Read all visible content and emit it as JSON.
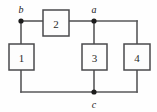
{
  "diagram": {
    "type": "circuit-schematic",
    "title": "",
    "background_color": "#fefefe",
    "wire_color": "#58585a",
    "box_stroke_color": "#4a4a4c",
    "box_fill_color": "#fdfdfd",
    "node_color": "#1c1c1c",
    "label_color": "#1c1c1c",
    "boxes": [
      {
        "id": "box-1",
        "label": "1",
        "orientation": "vertical",
        "x": 9,
        "y": 44,
        "w": 25,
        "h": 26
      },
      {
        "id": "box-2",
        "label": "2",
        "orientation": "horizontal",
        "x": 43,
        "y": 10,
        "w": 26,
        "h": 26
      },
      {
        "id": "box-3",
        "label": "3",
        "orientation": "vertical",
        "x": 82,
        "y": 44,
        "w": 25,
        "h": 26
      },
      {
        "id": "box-4",
        "label": "4",
        "orientation": "vertical",
        "x": 124,
        "y": 44,
        "w": 26,
        "h": 26
      }
    ],
    "nodes": [
      {
        "id": "node-b",
        "label": "b",
        "x": 21,
        "y": 21,
        "label_x": 21,
        "label_y": 9
      },
      {
        "id": "node-a",
        "label": "a",
        "x": 94,
        "y": 21,
        "label_x": 94,
        "label_y": 9
      },
      {
        "id": "node-c",
        "label": "c",
        "x": 94,
        "y": 92,
        "label_x": 94,
        "label_y": 104
      }
    ],
    "wires": [
      {
        "id": "wire-b-to-box2",
        "d": "M 21 21 L 43 21"
      },
      {
        "id": "wire-box2-to-a",
        "d": "M 69 21 L 94 21"
      },
      {
        "id": "wire-a-to-topright",
        "d": "M 94 21 L 137 21"
      },
      {
        "id": "wire-right-down",
        "d": "M 137 21 L 137 44"
      },
      {
        "id": "wire-b-down-box1",
        "d": "M 21 21 L 21 44"
      },
      {
        "id": "wire-box1-down",
        "d": "M 21 70 L 21 92"
      },
      {
        "id": "wire-bottom-rail",
        "d": "M 21 92 L 94 92"
      },
      {
        "id": "wire-bottom-right",
        "d": "M 94 92 L 137 92"
      },
      {
        "id": "wire-right-up-box4",
        "d": "M 137 92 L 137 70"
      },
      {
        "id": "wire-a-down-box3",
        "d": "M 94 21 L 94 44"
      },
      {
        "id": "wire-box3-down-c",
        "d": "M 94 70 L 94 92"
      }
    ]
  }
}
